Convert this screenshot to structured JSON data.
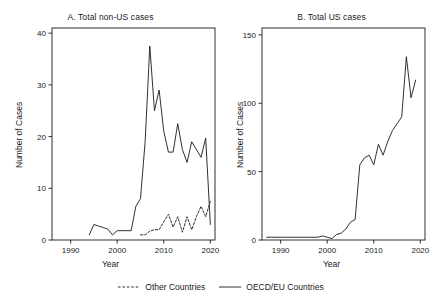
{
  "figure": {
    "background_color": "#ffffff",
    "line_color": "#1a1a1a",
    "axis_color": "#1a1a1a"
  },
  "legend": {
    "position": "bottom-center",
    "entries": [
      {
        "label": "Other Countries",
        "style": "dashed",
        "icon": "dashed-line-swatch"
      },
      {
        "label": "OECD/EU Countries",
        "style": "solid",
        "icon": "solid-line-swatch"
      }
    ]
  },
  "chart_data": [
    {
      "type": "line",
      "panel": "A",
      "title": "A. Total non-US cases",
      "xlabel": "Year",
      "ylabel": "Number of Cases",
      "xlim": [
        1986,
        2021
      ],
      "ylim": [
        0,
        41
      ],
      "xticks": [
        1990,
        2000,
        2010,
        2020
      ],
      "xtick_labels": [
        "1990",
        "2000",
        "2010",
        "2020"
      ],
      "yticks": [
        0,
        10,
        20,
        30,
        40
      ],
      "ytick_labels": [
        "0",
        "10",
        "20",
        "30",
        "40"
      ],
      "grid": false,
      "series": [
        {
          "name": "OECD/EU Countries",
          "style": "solid",
          "x": [
            1994,
            1995,
            1996,
            1997,
            1998,
            1999,
            2000,
            2001,
            2002,
            2003,
            2004,
            2005,
            2006,
            2007,
            2008,
            2009,
            2010,
            2011,
            2012,
            2013,
            2014,
            2015,
            2016,
            2017,
            2018,
            2019,
            2020
          ],
          "values": [
            1,
            3,
            2.7,
            2.4,
            2.1,
            1,
            1.8,
            1.8,
            1.8,
            1.8,
            6.5,
            8,
            19,
            37.5,
            25,
            29,
            21,
            17,
            17,
            22.5,
            17.5,
            15,
            19,
            17.5,
            16,
            19.7,
            3
          ]
        },
        {
          "name": "Other Countries",
          "style": "dashed",
          "x": [
            2005,
            2006,
            2007,
            2008,
            2009,
            2010,
            2011,
            2012,
            2013,
            2014,
            2015,
            2016,
            2017,
            2018,
            2019,
            2020
          ],
          "values": [
            1,
            1,
            1.7,
            2,
            2,
            3.5,
            5,
            2.5,
            4.5,
            1.5,
            4.5,
            2,
            4.5,
            6.5,
            4.5,
            7.5
          ]
        }
      ]
    },
    {
      "type": "line",
      "panel": "B",
      "title": "B. Total US cases",
      "xlabel": "Year",
      "ylabel": "Number of Cases",
      "xlim": [
        1986,
        2021
      ],
      "ylim": [
        0,
        155
      ],
      "xticks": [
        1990,
        2000,
        2010,
        2020
      ],
      "xtick_labels": [
        "1990",
        "2000",
        "2010",
        "2020"
      ],
      "yticks": [
        0,
        50,
        100,
        150
      ],
      "ytick_labels": [
        "0",
        "50",
        "100",
        "150"
      ],
      "grid": false,
      "series": [
        {
          "name": "Total US cases",
          "style": "solid",
          "x": [
            1987,
            1988,
            1989,
            1990,
            1991,
            1992,
            1993,
            1994,
            1995,
            1996,
            1997,
            1998,
            1999,
            2000,
            2001,
            2002,
            2003,
            2004,
            2005,
            2006,
            2007,
            2008,
            2009,
            2010,
            2011,
            2012,
            2013,
            2014,
            2015,
            2016,
            2017,
            2018,
            2019
          ],
          "values": [
            2,
            2,
            2,
            2,
            2,
            2,
            2,
            2,
            2,
            2,
            2,
            2,
            3,
            2,
            1,
            4,
            5,
            8,
            13,
            15,
            55,
            60,
            62,
            55,
            70,
            62,
            72,
            80,
            85,
            90,
            134,
            104,
            117
          ]
        }
      ]
    }
  ]
}
